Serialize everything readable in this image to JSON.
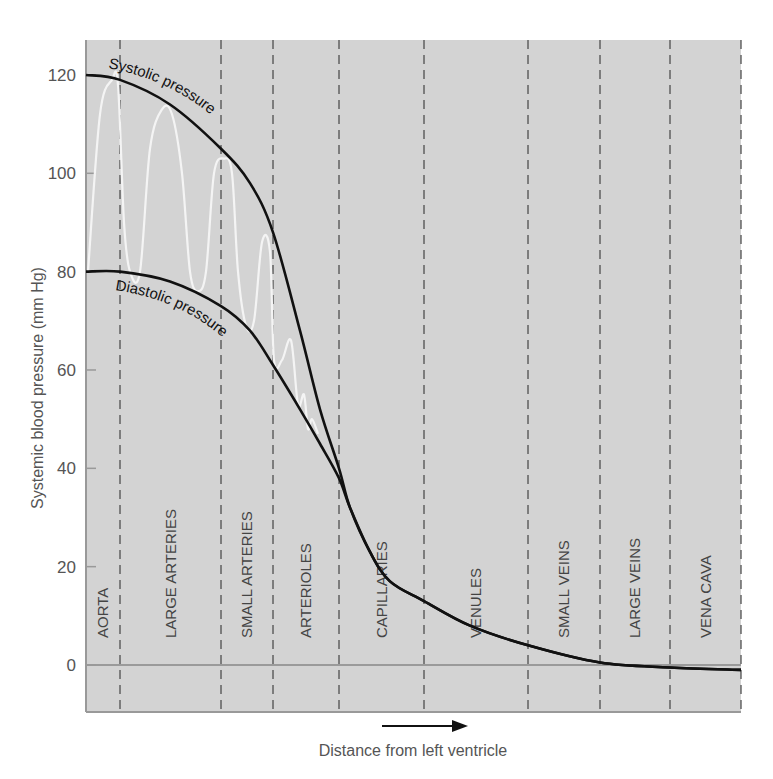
{
  "chart_data": {
    "type": "line",
    "title": "",
    "xlabel": "Distance from left ventricle",
    "ylabel": "Systemic blood pressure (mm Hg)",
    "ylim": [
      -10,
      130
    ],
    "yticks": [
      0,
      20,
      40,
      60,
      80,
      100,
      120
    ],
    "grid": false,
    "regions": [
      "AORTA",
      "LARGE ARTERIES",
      "SMALL ARTERIES",
      "ARTERIOLES",
      "CAPILLARIES",
      "VENULES",
      "SMALL VEINS",
      "LARGE VEINS",
      "VENA CAVA"
    ],
    "region_boundaries_px": [
      86,
      120,
      221,
      273,
      339,
      424,
      528,
      600,
      670,
      741
    ],
    "x_px": [
      86,
      120,
      170,
      221,
      250,
      273,
      300,
      320,
      339,
      350,
      370,
      390,
      424,
      470,
      528,
      600,
      670,
      741
    ],
    "series": [
      {
        "name": "Systolic pressure",
        "values": [
          120,
          119,
          114,
          105,
          98,
          88,
          68,
          52,
          40,
          32,
          23,
          17,
          13,
          8,
          4,
          0.5,
          -0.5,
          -1
        ]
      },
      {
        "name": "Diastolic pressure",
        "values": [
          80,
          80,
          78,
          73,
          68,
          61,
          52,
          45,
          38,
          32,
          23,
          17,
          13,
          8,
          4,
          0.5,
          -0.5,
          -1
        ]
      }
    ],
    "pulse_wave": {
      "name": "Pressure oscillation (white trace)",
      "points": [
        [
          88,
          80
        ],
        [
          100,
          112
        ],
        [
          112,
          119
        ],
        [
          118,
          118
        ],
        [
          124,
          90
        ],
        [
          130,
          80
        ],
        [
          140,
          80
        ],
        [
          150,
          105
        ],
        [
          162,
          113
        ],
        [
          172,
          112
        ],
        [
          182,
          100
        ],
        [
          190,
          80
        ],
        [
          198,
          76
        ],
        [
          206,
          80
        ],
        [
          214,
          100
        ],
        [
          224,
          103
        ],
        [
          232,
          100
        ],
        [
          238,
          80
        ],
        [
          246,
          69
        ],
        [
          254,
          70
        ],
        [
          262,
          86
        ],
        [
          270,
          84
        ],
        [
          274,
          62
        ],
        [
          282,
          62
        ],
        [
          291,
          66
        ],
        [
          298,
          53
        ],
        [
          304,
          55
        ],
        [
          308,
          48
        ],
        [
          312,
          50
        ],
        [
          318,
          47
        ]
      ]
    },
    "annotations": [
      {
        "text": "Systolic pressure",
        "follows": "Systolic pressure"
      },
      {
        "text": "Diastolic pressure",
        "follows": "Diastolic pressure"
      },
      {
        "text": "arrow",
        "direction": "right",
        "meaning": "distance increases"
      }
    ]
  },
  "axis": {
    "y_title": "Systemic blood pressure (mm Hg)",
    "x_title": "Distance from left ventricle",
    "y_ticks": [
      "0",
      "20",
      "40",
      "60",
      "80",
      "100",
      "120"
    ]
  },
  "labels": {
    "systolic": "Systolic pressure",
    "diastolic": "Diastolic pressure"
  },
  "colors": {
    "plot_bg": "#d3d3d3",
    "axis": "#999999",
    "curve": "#111111",
    "pulse": "#f4f4f4",
    "dash": "#444444",
    "text": "#555555"
  }
}
